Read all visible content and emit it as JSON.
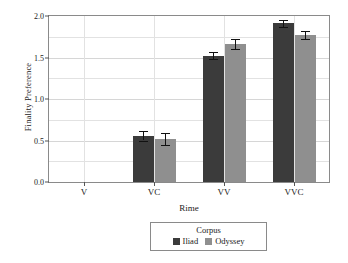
{
  "chart_data": {
    "type": "bar",
    "title": "",
    "xlabel": "Rime",
    "ylabel": "Finality Preference",
    "categories": [
      "V",
      "VC",
      "VV",
      "VVC"
    ],
    "ylim": [
      0.0,
      2.0
    ],
    "ytick_labels": [
      "0.0",
      "0.5",
      "1.0",
      "1.5",
      "2.0"
    ],
    "ytick_values": [
      0.0,
      0.5,
      1.0,
      1.5,
      2.0
    ],
    "minor_gridlines": [
      0.25,
      0.75,
      1.25,
      1.75
    ],
    "grid": true,
    "legend_title": "Corpus",
    "legend_position": "below",
    "series": [
      {
        "name": "Iliad",
        "color": "#3b3b3b",
        "values": [
          null,
          0.55,
          1.52,
          1.91
        ],
        "err_low": [
          null,
          0.5,
          1.48,
          1.87
        ],
        "err_high": [
          null,
          0.61,
          1.57,
          1.95
        ]
      },
      {
        "name": "Odyssey",
        "color": "#8f8f8f",
        "values": [
          null,
          0.52,
          1.66,
          1.77
        ],
        "err_low": [
          null,
          0.45,
          1.6,
          1.72
        ],
        "err_high": [
          null,
          0.59,
          1.72,
          1.82
        ]
      }
    ]
  },
  "colors": {
    "iliad": "#3b3b3b",
    "odyssey": "#8f8f8f",
    "axis": "#8a8a8a",
    "grid": "#e2e2e2",
    "text": "#1a1a1a",
    "background": "#ffffff"
  }
}
